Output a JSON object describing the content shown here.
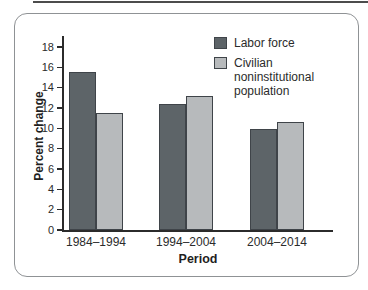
{
  "chart_data": {
    "type": "bar",
    "title": "",
    "xlabel": "Period",
    "ylabel": "Percent change",
    "categories": [
      "1984–1994",
      "1994–2004",
      "2004–2014"
    ],
    "series": [
      {
        "name": "Labor force",
        "values": [
          15.5,
          12.4,
          9.9
        ],
        "color": "#5d6468"
      },
      {
        "name": "Civilian noninstitutional population",
        "values": [
          11.5,
          13.2,
          10.6
        ],
        "color": "#b7babc"
      }
    ],
    "ylim": [
      0,
      18
    ],
    "ytick_step": 2,
    "grid": false,
    "legend_position": "top-right",
    "bar_outline_color": "#3f4449",
    "axis_color": "#2b2b2b"
  }
}
